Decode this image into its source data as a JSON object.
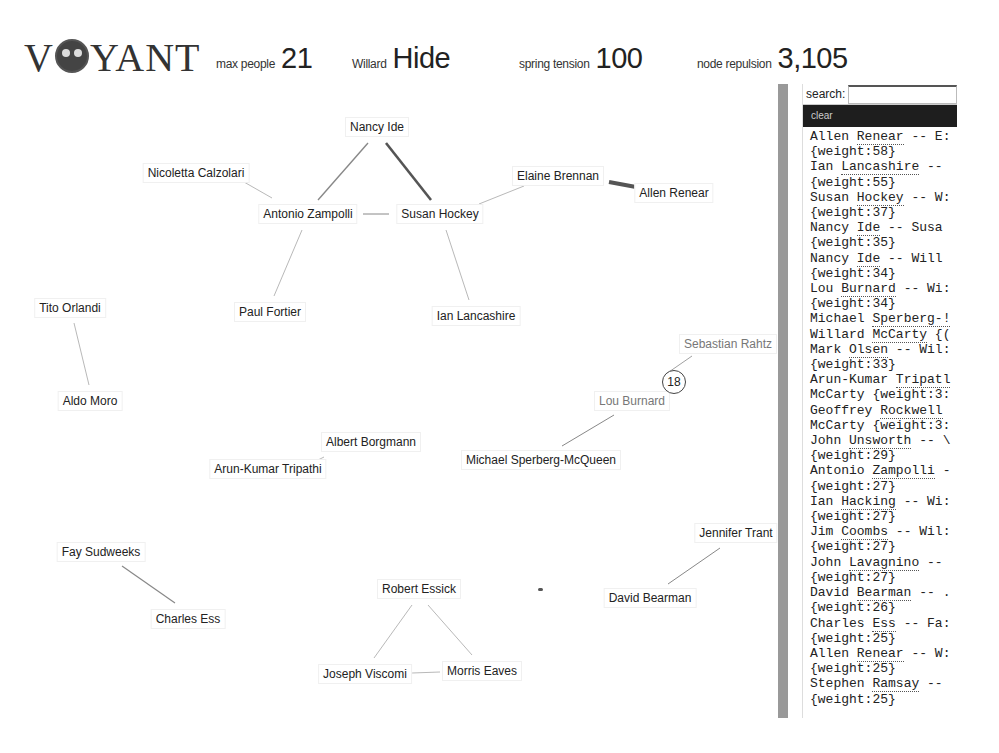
{
  "header": {
    "logo_prefix": "V",
    "logo_suffix": "YANT",
    "controls": [
      {
        "label": "max people",
        "value": "21"
      },
      {
        "label": "Willard",
        "value": "Hide"
      },
      {
        "label": "spring tension",
        "value": "100"
      },
      {
        "label": "node repulsion",
        "value": "3,105"
      }
    ]
  },
  "sidebar": {
    "search_label": "search:",
    "search_value": "",
    "clear_label": "clear",
    "entries": [
      {
        "name": "Allen Renear",
        "rest": " -- E:",
        "weight": "{weight:58}"
      },
      {
        "name": "Ian Lancashire",
        "rest": " --",
        "weight": "{weight:55}"
      },
      {
        "name": "Susan Hockey",
        "rest": " -- W:",
        "weight": "{weight:37}"
      },
      {
        "name": "Nancy Ide",
        "rest": " -- Susa",
        "weight": "{weight:35}"
      },
      {
        "name": "Nancy Ide",
        "rest": " -- Will",
        "weight": "{weight:34}"
      },
      {
        "name": "Lou Burnard",
        "rest": " -- Wi:",
        "weight": "{weight:34}"
      },
      {
        "name": "Michael Sperberg-!",
        "rest": "",
        "weight": ""
      },
      {
        "name": "Willard McCarty",
        "rest": " {(",
        "weight": ""
      },
      {
        "name": "Mark Olsen",
        "rest": " -- Wil:",
        "weight": "{weight:33}"
      },
      {
        "name": "Arun-Kumar Tripatl",
        "rest": "",
        "weight": "McCarty {weight:3:"
      },
      {
        "name": "Geoffrey Rockwell",
        "rest": "",
        "weight": "McCarty {weight:3:"
      },
      {
        "name": "John Unsworth",
        "rest": " -- \\",
        "weight": "{weight:29}"
      },
      {
        "name": "Antonio Zampolli",
        "rest": " -",
        "weight": "{weight:27}"
      },
      {
        "name": "Ian Hacking",
        "rest": " -- Wi:",
        "weight": "{weight:27}"
      },
      {
        "name": "Jim Coombs",
        "rest": " -- Wil:",
        "weight": "{weight:27}"
      },
      {
        "name": "John Lavagnino",
        "rest": " --",
        "weight": "{weight:27}"
      },
      {
        "name": "David Bearman",
        "rest": " -- .",
        "weight": "{weight:26}"
      },
      {
        "name": "Charles Ess",
        "rest": " -- Fa:",
        "weight": "{weight:25}"
      },
      {
        "name": "Allen Renear",
        "rest": " -- W:",
        "weight": "{weight:25}"
      },
      {
        "name": "Stephen Ramsay",
        "rest": " --",
        "weight": "{weight:25}"
      }
    ]
  },
  "graph": {
    "badge": "18",
    "nodes": [
      {
        "id": "nancy",
        "label": "Nancy Ide",
        "x": 377,
        "y": 43
      },
      {
        "id": "nicoletta",
        "label": "Nicoletta Calzolari",
        "x": 196,
        "y": 89
      },
      {
        "id": "antonio",
        "label": "Antonio Zampolli",
        "x": 308,
        "y": 130
      },
      {
        "id": "susan",
        "label": "Susan Hockey",
        "x": 440,
        "y": 130
      },
      {
        "id": "elaine",
        "label": "Elaine Brennan",
        "x": 558,
        "y": 92
      },
      {
        "id": "allen",
        "label": "Allen Renear",
        "x": 674,
        "y": 109
      },
      {
        "id": "tito",
        "label": "Tito Orlandi",
        "x": 70,
        "y": 224
      },
      {
        "id": "paul",
        "label": "Paul Fortier",
        "x": 270,
        "y": 228
      },
      {
        "id": "ian",
        "label": "Ian Lancashire",
        "x": 476,
        "y": 232
      },
      {
        "id": "sebastian",
        "label": "Sebastian Rahtz",
        "x": 728,
        "y": 260,
        "faint": true
      },
      {
        "id": "lou",
        "label": "Lou Burnard",
        "x": 632,
        "y": 317,
        "faint": true
      },
      {
        "id": "aldo",
        "label": "Aldo Moro",
        "x": 90,
        "y": 317
      },
      {
        "id": "albert",
        "label": "Albert Borgmann",
        "x": 371,
        "y": 358
      },
      {
        "id": "arun",
        "label": "Arun-Kumar Tripathi",
        "x": 268,
        "y": 385
      },
      {
        "id": "michael",
        "label": "Michael Sperberg-McQueen",
        "x": 541,
        "y": 376
      },
      {
        "id": "jennifer",
        "label": "Jennifer Trant",
        "x": 736,
        "y": 449
      },
      {
        "id": "fay",
        "label": "Fay Sudweeks",
        "x": 101,
        "y": 468
      },
      {
        "id": "robert",
        "label": "Robert Essick",
        "x": 419,
        "y": 505
      },
      {
        "id": "david",
        "label": "David Bearman",
        "x": 650,
        "y": 514
      },
      {
        "id": "charles",
        "label": "Charles Ess",
        "x": 188,
        "y": 535
      },
      {
        "id": "joseph",
        "label": "Joseph Viscomi",
        "x": 365,
        "y": 590
      },
      {
        "id": "morris",
        "label": "Morris Eaves",
        "x": 482,
        "y": 587
      }
    ],
    "edges": [
      {
        "x1": 368,
        "y1": 59,
        "x2": 318,
        "y2": 116,
        "w": 1.4
      },
      {
        "x1": 386,
        "y1": 59,
        "x2": 431,
        "y2": 116,
        "w": 2.6
      },
      {
        "x1": 244,
        "y1": 98,
        "x2": 272,
        "y2": 114,
        "w": 0.6
      },
      {
        "x1": 363,
        "y1": 130,
        "x2": 389,
        "y2": 130,
        "w": 1
      },
      {
        "x1": 479,
        "y1": 120,
        "x2": 524,
        "y2": 102,
        "w": 0.6
      },
      {
        "x1": 609,
        "y1": 98,
        "x2": 636,
        "y2": 103,
        "w": 4
      },
      {
        "x1": 302,
        "y1": 146,
        "x2": 274,
        "y2": 212,
        "w": 0.6
      },
      {
        "x1": 446,
        "y1": 146,
        "x2": 469,
        "y2": 216,
        "w": 0.6
      },
      {
        "x1": 74,
        "y1": 239,
        "x2": 89,
        "y2": 301,
        "w": 0.6
      },
      {
        "x1": 692,
        "y1": 272,
        "x2": 666,
        "y2": 290,
        "w": 0.8
      },
      {
        "x1": 614,
        "y1": 331,
        "x2": 562,
        "y2": 362,
        "w": 1
      },
      {
        "x1": 324,
        "y1": 373,
        "x2": 318,
        "y2": 376,
        "w": 0.6
      },
      {
        "x1": 720,
        "y1": 464,
        "x2": 668,
        "y2": 500,
        "w": 1
      },
      {
        "x1": 122,
        "y1": 482,
        "x2": 175,
        "y2": 519,
        "w": 1.2
      },
      {
        "x1": 412,
        "y1": 521,
        "x2": 374,
        "y2": 574,
        "w": 0.6
      },
      {
        "x1": 428,
        "y1": 521,
        "x2": 472,
        "y2": 571,
        "w": 0.6
      },
      {
        "x1": 412,
        "y1": 589,
        "x2": 440,
        "y2": 588,
        "w": 0.6
      }
    ]
  }
}
